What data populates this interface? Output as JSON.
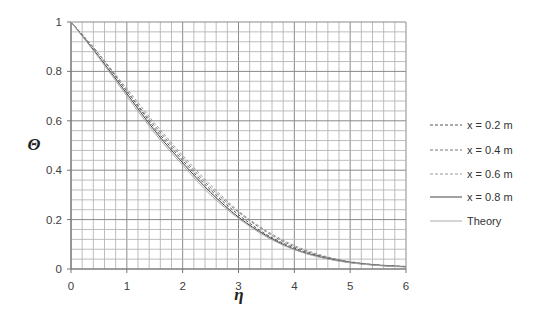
{
  "chart_data": {
    "type": "line",
    "title": "",
    "xlabel": "η",
    "ylabel": "Θ",
    "xlim": [
      0,
      6
    ],
    "ylim": [
      0,
      1
    ],
    "xticks": [
      0,
      1,
      2,
      3,
      4,
      5,
      6
    ],
    "yticks": [
      0,
      0.2,
      0.4,
      0.6,
      0.8,
      1
    ],
    "ytick_labels": [
      "0",
      "0.2",
      "0.4",
      "0.6",
      "0.8",
      "1"
    ],
    "grid": true,
    "minor_grid_x_step": 0.2,
    "minor_grid_y_step": 0.04,
    "legend_position": "right",
    "x": [
      0,
      0.5,
      1,
      1.5,
      2,
      2.5,
      3,
      3.5,
      4,
      4.5,
      5,
      5.5,
      6
    ],
    "series": [
      {
        "name": "x = 0.2 m",
        "style": "dashed",
        "color": "#555555",
        "values": [
          1.0,
          0.87,
          0.72,
          0.57,
          0.44,
          0.32,
          0.22,
          0.14,
          0.085,
          0.05,
          0.028,
          0.016,
          0.01
        ]
      },
      {
        "name": "x = 0.4 m",
        "style": "dashed",
        "color": "#777777",
        "values": [
          1.0,
          0.87,
          0.72,
          0.58,
          0.45,
          0.33,
          0.23,
          0.15,
          0.09,
          0.052,
          0.029,
          0.016,
          0.01
        ]
      },
      {
        "name": "x = 0.6 m",
        "style": "dashed",
        "color": "#999999",
        "values": [
          1.0,
          0.87,
          0.73,
          0.59,
          0.46,
          0.34,
          0.235,
          0.155,
          0.095,
          0.055,
          0.03,
          0.017,
          0.01
        ]
      },
      {
        "name": "x = 0.8 m",
        "style": "solid",
        "color": "#444444",
        "values": [
          1.0,
          0.86,
          0.71,
          0.56,
          0.43,
          0.31,
          0.21,
          0.135,
          0.08,
          0.047,
          0.026,
          0.015,
          0.009
        ]
      },
      {
        "name": "Theory",
        "style": "solid",
        "color": "#aaaaaa",
        "values": [
          1.0,
          0.855,
          0.7,
          0.55,
          0.42,
          0.3,
          0.205,
          0.13,
          0.078,
          0.045,
          0.025,
          0.014,
          0.008
        ]
      }
    ]
  },
  "legend": {
    "items": [
      {
        "label": "x = 0.2 m"
      },
      {
        "label": "x = 0.4 m"
      },
      {
        "label": "x = 0.6 m"
      },
      {
        "label": "x = 0.8 m"
      },
      {
        "label": "Theory"
      }
    ]
  }
}
